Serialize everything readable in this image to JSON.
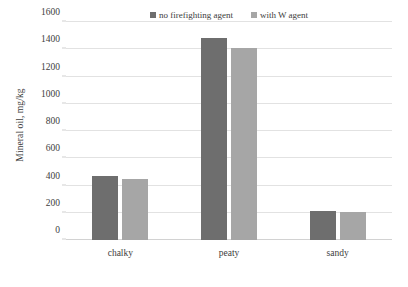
{
  "chart_data": {
    "type": "bar",
    "title": "",
    "xlabel": "",
    "ylabel": "Mineral oil, mg/kg",
    "ylim": [
      0,
      1600
    ],
    "yticks": [
      0,
      200,
      400,
      600,
      800,
      1000,
      1200,
      1400,
      1600
    ],
    "ytick_labels": [
      "0",
      "200",
      "400",
      "600",
      "800",
      "1000",
      "1200",
      "1400",
      "1600"
    ],
    "grid": true,
    "legend_position": "top-center",
    "categories": [
      "chalky",
      "peaty",
      "sandy"
    ],
    "series": [
      {
        "name": "no firefighting agent",
        "color": "#6e6e6e",
        "values": [
          470,
          1480,
          215
        ]
      },
      {
        "name": "with W agent",
        "color": "#a6a6a6",
        "values": [
          450,
          1410,
          205
        ]
      }
    ]
  },
  "caption": {
    "text": ""
  }
}
